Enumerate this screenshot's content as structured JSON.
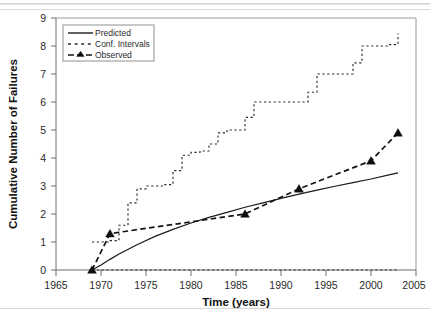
{
  "figure": {
    "background": "#ffffff",
    "ink_color": "#1a1a1a",
    "frame_color": "#9a9a9a"
  },
  "axes": {
    "x_title": "Time (years)",
    "y_title": "Cumulative Number of Failures",
    "x_ticks": [
      "1965",
      "1970",
      "1975",
      "1980",
      "1985",
      "1990",
      "1995",
      "2000",
      "2005"
    ],
    "y_ticks": [
      "0",
      "1",
      "2",
      "3",
      "4",
      "5",
      "6",
      "7",
      "8",
      "9"
    ]
  },
  "legend": {
    "items": [
      {
        "label": "Predicted",
        "style": "solid"
      },
      {
        "label": "Conf. Intervals",
        "style": "dotted"
      },
      {
        "label": "Observed",
        "style": "dashed-marker"
      }
    ]
  },
  "chart_data": {
    "type": "line",
    "title": "",
    "subtitle": "",
    "xlabel": "Time (years)",
    "ylabel": "Cumulative Number of Failures",
    "xlim": [
      1965,
      2005
    ],
    "ylim": [
      0,
      9
    ],
    "xticks": [
      1965,
      1970,
      1975,
      1980,
      1985,
      1990,
      1995,
      2000,
      2005
    ],
    "yticks": [
      0,
      1,
      2,
      3,
      4,
      5,
      6,
      7,
      8,
      9
    ],
    "grid": false,
    "legend_position": "top-left",
    "series": [
      {
        "name": "Predicted",
        "style": "solid",
        "marker": "none",
        "x": [
          1969,
          1970,
          1971,
          1972,
          1974,
          1976,
          1978,
          1980,
          1982,
          1984,
          1986,
          1988,
          1990,
          1992,
          1994,
          1996,
          1998,
          2000,
          2002,
          2003
        ],
        "y": [
          0.0,
          0.18,
          0.38,
          0.57,
          0.9,
          1.2,
          1.45,
          1.68,
          1.88,
          2.06,
          2.24,
          2.4,
          2.56,
          2.71,
          2.85,
          2.99,
          3.12,
          3.25,
          3.4,
          3.47
        ]
      },
      {
        "name": "Conf. Intervals",
        "style": "dotted",
        "marker": "none",
        "note": "upper confidence band, step function",
        "band": "upper",
        "x": [
          1969,
          1970,
          1971,
          1972,
          1973,
          1974,
          1975,
          1976,
          1977,
          1978,
          1979,
          1980,
          1981,
          1982,
          1983,
          1984,
          1985,
          1986,
          1987,
          1988,
          1989,
          1990,
          1991,
          1992,
          1993,
          1994,
          1995,
          1996,
          1997,
          1998,
          1999,
          2000,
          2001,
          2002,
          2003
        ],
        "y": [
          1.0,
          1.0,
          1.05,
          1.6,
          2.4,
          2.9,
          3.0,
          3.0,
          3.05,
          3.55,
          4.1,
          4.2,
          4.25,
          4.5,
          4.9,
          5.0,
          5.0,
          5.45,
          6.0,
          6.0,
          6.0,
          6.0,
          6.0,
          6.0,
          6.35,
          7.0,
          7.0,
          7.0,
          7.0,
          7.4,
          8.0,
          8.0,
          8.0,
          8.05,
          8.45
        ]
      },
      {
        "name": "Conf. Intervals",
        "style": "dotted",
        "marker": "none",
        "note": "lower confidence band, flat at zero",
        "band": "lower",
        "x": [
          1969,
          1975,
          1980,
          1985,
          1990,
          1995,
          2000,
          2003
        ],
        "y": [
          0.0,
          0.0,
          0.0,
          0.0,
          0.0,
          0.0,
          0.0,
          0.0
        ]
      },
      {
        "name": "Observed",
        "style": "dashed",
        "marker": "triangle",
        "x": [
          1969,
          1971,
          1986,
          1992,
          2000,
          2003
        ],
        "y": [
          0.0,
          1.3,
          2.0,
          2.9,
          3.9,
          4.9
        ]
      }
    ]
  }
}
